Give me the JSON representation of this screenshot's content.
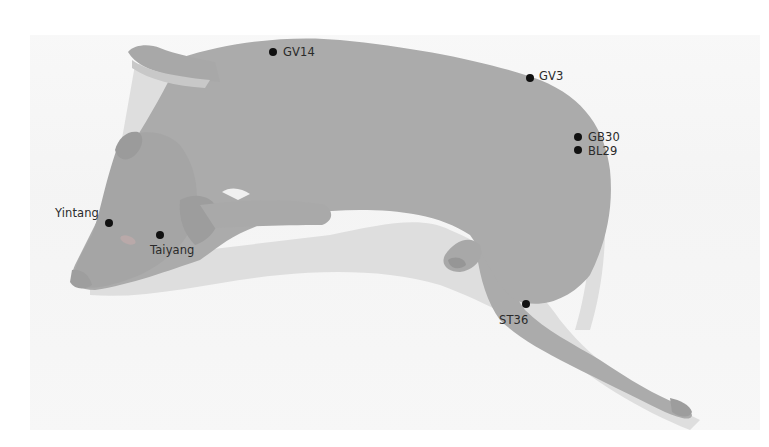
{
  "diagram": {
    "colors": {
      "body": "#ababab",
      "body_dark": "#9c9c9c",
      "shadow": "#dcdcdc",
      "background_band": "#f4f4f4",
      "point": "#111111",
      "label": "#2a2a2a"
    },
    "points": [
      {
        "id": "GV14",
        "label": "GV14",
        "x": 273,
        "y": 52,
        "label_x": 283,
        "label_y": 45
      },
      {
        "id": "GV3",
        "label": "GV3",
        "x": 530,
        "y": 78,
        "label_x": 539,
        "label_y": 69
      },
      {
        "id": "GB30",
        "label": "GB30",
        "x": 578,
        "y": 137,
        "label_x": 588,
        "label_y": 130
      },
      {
        "id": "BL29",
        "label": "BL29",
        "x": 578,
        "y": 150,
        "label_x": 588,
        "label_y": 144
      },
      {
        "id": "Yintang",
        "label": "Yintang",
        "x": 109,
        "y": 223,
        "label_x": 55,
        "label_y": 206
      },
      {
        "id": "Taiyang",
        "label": "Taiyang",
        "x": 160,
        "y": 235,
        "label_x": 150,
        "label_y": 243
      },
      {
        "id": "ST36",
        "label": "ST36",
        "x": 526,
        "y": 304,
        "label_x": 499,
        "label_y": 313
      }
    ]
  }
}
